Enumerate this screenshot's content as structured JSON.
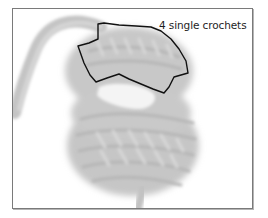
{
  "figure": {
    "callout": {
      "label": "4 single crochets"
    },
    "colors": {
      "frame_border": "#7a7a7a",
      "yarn": "#c9c9c9",
      "yarn_shadow": "#b3b3b3",
      "yarn_highlight": "#dcdcdc",
      "outline": "#111111",
      "label_text": "#1e1e1e",
      "background": "#ffffff"
    }
  }
}
